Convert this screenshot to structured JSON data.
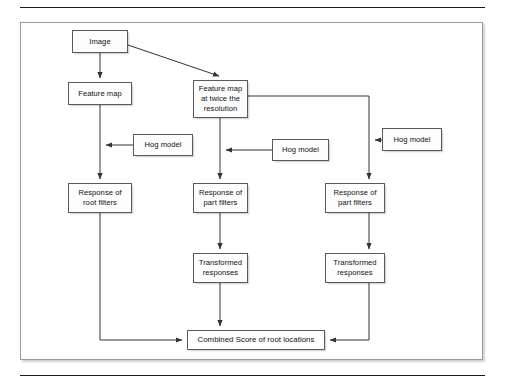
{
  "figure": {
    "background_color": "#ffffff",
    "border_color": "#9a9a9a",
    "node_border_color": "#5a5a5a",
    "node_fill_color": "#fdfdfd",
    "line_color": "#333333"
  },
  "nodes": [
    {
      "id": "image",
      "label": "Image",
      "x": 72,
      "y": 30,
      "w": 56,
      "h": 23
    },
    {
      "id": "feature-map",
      "label": "Feature map",
      "x": 68,
      "y": 82,
      "w": 64,
      "h": 23
    },
    {
      "id": "feature-map-2x",
      "label": "Feature map\nat twice the\nresolution",
      "x": 193,
      "y": 80,
      "w": 55,
      "h": 38
    },
    {
      "id": "hog-model-left",
      "label": "Hog model",
      "x": 133,
      "y": 134,
      "w": 60,
      "h": 22
    },
    {
      "id": "hog-model-middle",
      "label": "Hog model",
      "x": 272,
      "y": 139,
      "w": 57,
      "h": 22
    },
    {
      "id": "hog-model-right",
      "label": "Hog model",
      "x": 382,
      "y": 128,
      "w": 60,
      "h": 23
    },
    {
      "id": "response-root",
      "label": "Response of\nroot filters",
      "x": 68,
      "y": 183,
      "w": 64,
      "h": 30
    },
    {
      "id": "response-part-mid",
      "label": "Response of\npart filters",
      "x": 193,
      "y": 183,
      "w": 55,
      "h": 30
    },
    {
      "id": "response-part-right",
      "label": "Response of\npart filters",
      "x": 325,
      "y": 183,
      "w": 60,
      "h": 30
    },
    {
      "id": "transformed-mid",
      "label": "Transformed\nresponses",
      "x": 193,
      "y": 253,
      "w": 55,
      "h": 30
    },
    {
      "id": "transformed-right",
      "label": "Transformed\nresponses",
      "x": 325,
      "y": 253,
      "w": 60,
      "h": 30
    },
    {
      "id": "combined-score",
      "label": "Combined Score of root locations",
      "x": 187,
      "y": 330,
      "w": 138,
      "h": 20
    }
  ],
  "edges": [
    {
      "from": "image",
      "to": "feature-map",
      "kind": "vertical-arrow"
    },
    {
      "from": "image",
      "to": "feature-map-2x",
      "kind": "diagonal-arrow"
    },
    {
      "from": "feature-map",
      "to": "response-root",
      "kind": "vertical-arrow"
    },
    {
      "from": "hog-model-left",
      "to": "feature-map-branch",
      "kind": "horizontal-arrow-left"
    },
    {
      "from": "feature-map-2x",
      "to": "response-part-mid",
      "kind": "vertical-arrow"
    },
    {
      "from": "hog-model-middle",
      "to": "middle-branch",
      "kind": "horizontal-arrow-left"
    },
    {
      "from": "feature-map-2x",
      "to": "response-part-right",
      "kind": "elbow-right-down-arrow"
    },
    {
      "from": "hog-model-right",
      "to": "right-branch",
      "kind": "horizontal-arrow-left"
    },
    {
      "from": "response-part-mid",
      "to": "transformed-mid",
      "kind": "vertical-arrow"
    },
    {
      "from": "response-part-right",
      "to": "transformed-right",
      "kind": "vertical-arrow"
    },
    {
      "from": "transformed-mid",
      "to": "combined-score",
      "kind": "vertical-arrow"
    },
    {
      "from": "response-root",
      "to": "combined-score",
      "kind": "elbow-down-right-arrow"
    },
    {
      "from": "transformed-right",
      "to": "combined-score",
      "kind": "elbow-down-left-arrow"
    }
  ]
}
